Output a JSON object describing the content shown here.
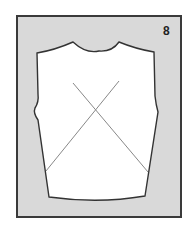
{
  "figure": {
    "step_number": "8",
    "colors": {
      "background": "#d9d9d9",
      "piece": "#ffffff",
      "outline": "#333333",
      "cross_lines": "#888888"
    }
  }
}
